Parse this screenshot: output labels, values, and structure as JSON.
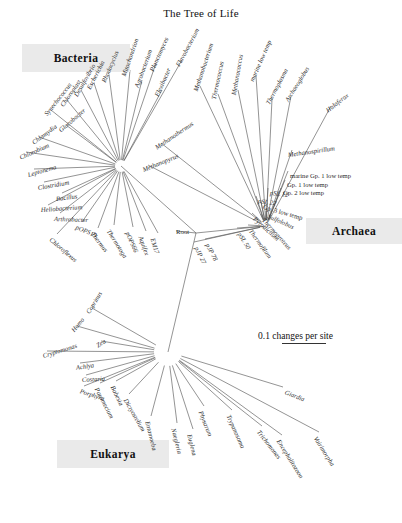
{
  "figure": {
    "title": "The Tree of Life",
    "scale": {
      "label": "0.1 changes per site"
    },
    "root_label": "Root"
  },
  "domains": {
    "bacteria": {
      "label": "Bacteria"
    },
    "archaea": {
      "label": "Archaea"
    },
    "eukarya": {
      "label": "Eukarya"
    }
  },
  "chart_data": {
    "type": "tree",
    "title": "The Tree of Life",
    "scale_bar": {
      "text": "0.1 changes per site",
      "value": 0.1,
      "units": "changes per site"
    },
    "root": "Root",
    "groups": [
      {
        "name": "Bacteria",
        "taxa": [
          "Planctomyces",
          "Mitochondrion",
          "Agrobacterium",
          "Rhodocyclus",
          "Escherichia",
          "Desulfovibrio",
          "Chloroplast",
          "Synechococcus",
          "Gloeobacter",
          "Chlamydia",
          "Chlorobium",
          "Leptonema",
          "Clostridium",
          "Bacillus",
          "Heliobacterium",
          "Arthrobacter",
          "pOPS19",
          "Chloroflexus",
          "Thermus",
          "Thermotoga",
          "pOPS66",
          "Aquifex",
          "EM17",
          "Flavobacterium",
          "Flexibacter"
        ]
      },
      {
        "name": "Archaea",
        "taxa": [
          "Methanopyrus",
          "Methanothermus",
          "Methanobacterium",
          "Thermococcus",
          "Methanococcus",
          "marine low temp",
          "Thermoplasma",
          "Archaeoglobus",
          "Haloferax",
          "Methanospirillum",
          "marine Gp. 1 low temp",
          "Gp. 1 low temp",
          "Gp. 2 low temp",
          "pSL 12",
          "pSL 22",
          "Gp. 3 low temp",
          "Sulfolobus",
          "Pyrodictium",
          "Thermoproteus",
          "Thermofilum",
          "pSL 50",
          "pJP 78",
          "pJP 27"
        ]
      },
      {
        "name": "Eukarya",
        "taxa": [
          "Coprinus",
          "Homo",
          "Zea",
          "Cryptomonas",
          "Achlya",
          "Costaria",
          "Porphyra",
          "Paramecium",
          "Babesia",
          "Dictyostelium",
          "Entamoeba",
          "Naegleria",
          "Euglena",
          "Physarum",
          "Trypanosoma",
          "Giardia",
          "Trichomonas",
          "Encephalitozoon",
          "Vairimorpha"
        ]
      }
    ]
  },
  "tips": {
    "bacteria": [
      {
        "name": "Planctomyces",
        "x": 152,
        "y": 68,
        "rot": -66,
        "anchor": "start",
        "italic": true
      },
      {
        "name": "Mitochondrion",
        "x": 124,
        "y": 73,
        "rot": -71,
        "anchor": "start",
        "italic": true
      },
      {
        "name": "Agrobacterium",
        "x": 137,
        "y": 84,
        "rot": -70,
        "anchor": "start",
        "italic": true
      },
      {
        "name": "Rhodocyclus",
        "x": 104,
        "y": 79,
        "rot": -67,
        "anchor": "start",
        "italic": true
      },
      {
        "name": "Escherichia",
        "x": 89,
        "y": 86,
        "rot": -63,
        "anchor": "start",
        "italic": true
      },
      {
        "name": "Desulfovibrio",
        "x": 76,
        "y": 93,
        "rot": -60,
        "anchor": "start",
        "italic": true
      },
      {
        "name": "Chloroplast",
        "x": 62,
        "y": 103,
        "rot": -55,
        "anchor": "start",
        "italic": true
      },
      {
        "name": "Synechococcus",
        "x": 46,
        "y": 112,
        "rot": -52,
        "anchor": "start",
        "italic": true
      },
      {
        "name": "Gloeobacter",
        "x": 60,
        "y": 128,
        "rot": -41,
        "anchor": "start",
        "italic": true
      },
      {
        "name": "Chlamydia",
        "x": 33,
        "y": 140,
        "rot": -36,
        "anchor": "start",
        "italic": true
      },
      {
        "name": "Chlorobium",
        "x": 20,
        "y": 155,
        "rot": -24,
        "anchor": "start",
        "italic": true
      },
      {
        "name": "Leptonema",
        "x": 28,
        "y": 172,
        "rot": -16,
        "anchor": "start",
        "italic": true
      },
      {
        "name": "Clostridium",
        "x": 38,
        "y": 185,
        "rot": -10,
        "anchor": "start",
        "italic": true
      },
      {
        "name": "Bacillus",
        "x": 56,
        "y": 196,
        "rot": -7,
        "anchor": "start",
        "italic": true
      },
      {
        "name": "Heliobacterium",
        "x": 41,
        "y": 207,
        "rot": -4,
        "anchor": "start",
        "italic": true
      },
      {
        "name": "Arthrobacter",
        "x": 54,
        "y": 216,
        "rot": 2,
        "anchor": "start",
        "italic": true
      },
      {
        "name": "pOPS19",
        "x": 76,
        "y": 224,
        "rot": 23,
        "anchor": "start",
        "italic": true
      },
      {
        "name": "Chloroflexus",
        "x": 50,
        "y": 236,
        "rot": 40,
        "anchor": "start",
        "italic": true
      },
      {
        "name": "Thermus",
        "x": 92,
        "y": 230,
        "rot": 52,
        "anchor": "start",
        "italic": true
      },
      {
        "name": "Thermotoga",
        "x": 108,
        "y": 227,
        "rot": 58,
        "anchor": "start",
        "italic": true
      },
      {
        "name": "pOPS66",
        "x": 127,
        "y": 229,
        "rot": 66,
        "anchor": "start",
        "italic": true
      },
      {
        "name": "Aquifex",
        "x": 140,
        "y": 233,
        "rot": 70,
        "anchor": "start",
        "italic": true
      },
      {
        "name": "EM17",
        "x": 152,
        "y": 235,
        "rot": 72,
        "anchor": "start",
        "italic": true
      },
      {
        "name": "Flavobacterium",
        "x": 178,
        "y": 63,
        "rot": -62,
        "anchor": "start",
        "italic": true
      },
      {
        "name": "Flexibacter",
        "x": 157,
        "y": 93,
        "rot": -66,
        "anchor": "start",
        "italic": true
      }
    ],
    "archaea": [
      {
        "name": "Methanobacterium",
        "x": 196,
        "y": 88,
        "rot": -72,
        "anchor": "start",
        "italic": true
      },
      {
        "name": "Thermococcus",
        "x": 214,
        "y": 96,
        "rot": -78,
        "anchor": "start",
        "italic": true
      },
      {
        "name": "Methanococcus",
        "x": 234,
        "y": 92,
        "rot": -80,
        "anchor": "start",
        "italic": true
      },
      {
        "name": "marine low temp",
        "x": 252,
        "y": 78,
        "rot": -66,
        "anchor": "start",
        "italic": true
      },
      {
        "name": "Thermoplasma",
        "x": 268,
        "y": 101,
        "rot": -62,
        "anchor": "start",
        "italic": true
      },
      {
        "name": "Archaeoglobus",
        "x": 287,
        "y": 98,
        "rot": -58,
        "anchor": "start",
        "italic": true
      },
      {
        "name": "Haloferax",
        "x": 327,
        "y": 108,
        "rot": -38,
        "anchor": "start",
        "italic": true
      },
      {
        "name": "Methanospirillum",
        "x": 288,
        "y": 152,
        "rot": -8,
        "anchor": "start",
        "italic": true
      },
      {
        "name": "Methanothermus",
        "x": 156,
        "y": 145,
        "rot": -34,
        "anchor": "start",
        "italic": true
      },
      {
        "name": "Methanopyrus",
        "x": 143,
        "y": 167,
        "rot": -22,
        "anchor": "start",
        "italic": true
      },
      {
        "name": "marine Gp. 1 low temp",
        "x": 290,
        "y": 173,
        "rot": 0,
        "anchor": "start",
        "italic": false
      },
      {
        "name": "Gp. 1 low temp",
        "x": 287,
        "y": 182,
        "rot": 0,
        "anchor": "start",
        "italic": false
      },
      {
        "name": "Gp. 2 low temp",
        "x": 283,
        "y": 190,
        "rot": 0,
        "anchor": "start",
        "italic": false
      },
      {
        "name": "pSL 12",
        "x": 270,
        "y": 190,
        "rot": 6,
        "anchor": "start",
        "italic": true
      },
      {
        "name": "pSL 22",
        "x": 258,
        "y": 198,
        "rot": 8,
        "anchor": "start",
        "italic": true
      },
      {
        "name": "Gp. 3 low temp",
        "x": 263,
        "y": 204,
        "rot": 16,
        "anchor": "start",
        "italic": false
      },
      {
        "name": "Sulfolobus",
        "x": 268,
        "y": 213,
        "rot": 24,
        "anchor": "start",
        "italic": true
      },
      {
        "name": "Pyrodictium",
        "x": 254,
        "y": 215,
        "rot": 42,
        "anchor": "start",
        "italic": true
      },
      {
        "name": "Thermoproteus",
        "x": 263,
        "y": 216,
        "rot": 48,
        "anchor": "start",
        "italic": true
      },
      {
        "name": "Thermofilum",
        "x": 250,
        "y": 227,
        "rot": 54,
        "anchor": "start",
        "italic": true
      },
      {
        "name": "pSL 50",
        "x": 239,
        "y": 230,
        "rot": 58,
        "anchor": "start",
        "italic": true
      },
      {
        "name": "pJP 78",
        "x": 207,
        "y": 241,
        "rot": 62,
        "anchor": "start",
        "italic": true
      },
      {
        "name": "pJP 27",
        "x": 196,
        "y": 244,
        "rot": 64,
        "anchor": "start",
        "italic": true
      }
    ],
    "eukarya": [
      {
        "name": "Coprinus",
        "x": 88,
        "y": 310,
        "rot": -58,
        "anchor": "start",
        "italic": true
      },
      {
        "name": "Homo",
        "x": 73,
        "y": 328,
        "rot": -50,
        "anchor": "start",
        "italic": true
      },
      {
        "name": "Zea",
        "x": 97,
        "y": 343,
        "rot": -32,
        "anchor": "start",
        "italic": true
      },
      {
        "name": "Cryptomonas",
        "x": 43,
        "y": 353,
        "rot": -17,
        "anchor": "start",
        "italic": true
      },
      {
        "name": "Achlya",
        "x": 76,
        "y": 365,
        "rot": -9,
        "anchor": "start",
        "italic": true
      },
      {
        "name": "Costaria",
        "x": 82,
        "y": 377,
        "rot": -3,
        "anchor": "start",
        "italic": true
      },
      {
        "name": "Porphyra",
        "x": 80,
        "y": 388,
        "rot": 18,
        "anchor": "start",
        "italic": true
      },
      {
        "name": "Paramecium",
        "x": 96,
        "y": 385,
        "rot": 62,
        "anchor": "start",
        "italic": true
      },
      {
        "name": "Babesia",
        "x": 112,
        "y": 383,
        "rot": 64,
        "anchor": "start",
        "italic": true
      },
      {
        "name": "Dictyostelium",
        "x": 125,
        "y": 396,
        "rot": 60,
        "anchor": "start",
        "italic": true
      },
      {
        "name": "Entamoeba",
        "x": 147,
        "y": 418,
        "rot": 76,
        "anchor": "start",
        "italic": true
      },
      {
        "name": "Naegleria",
        "x": 173,
        "y": 425,
        "rot": 76,
        "anchor": "start",
        "italic": true
      },
      {
        "name": "Euglena",
        "x": 189,
        "y": 431,
        "rot": 76,
        "anchor": "start",
        "italic": true
      },
      {
        "name": "Physarum",
        "x": 200,
        "y": 408,
        "rot": 68,
        "anchor": "start",
        "italic": true
      },
      {
        "name": "Trypanosoma",
        "x": 228,
        "y": 412,
        "rot": 66,
        "anchor": "start",
        "italic": true
      },
      {
        "name": "Giardia",
        "x": 285,
        "y": 389,
        "rot": 22,
        "anchor": "start",
        "italic": true
      },
      {
        "name": "Trichomonas",
        "x": 258,
        "y": 428,
        "rot": 52,
        "anchor": "start",
        "italic": true
      },
      {
        "name": "Encephalitozoon",
        "x": 278,
        "y": 437,
        "rot": 58,
        "anchor": "start",
        "italic": true
      },
      {
        "name": "Vairimorpha",
        "x": 315,
        "y": 434,
        "rot": 58,
        "anchor": "start",
        "italic": true
      }
    ]
  },
  "branches": {
    "bacteria_node": {
      "x": 121,
      "y": 166
    },
    "archaea_node": {
      "x": 266,
      "y": 226
    },
    "eukarya_node": {
      "x": 168,
      "y": 352
    },
    "root_node": {
      "x": 196,
      "y": 233
    },
    "bacteria_tips": [
      [
        156,
        63
      ],
      [
        130,
        70
      ],
      [
        142,
        80
      ],
      [
        109,
        75
      ],
      [
        94,
        83
      ],
      [
        81,
        90
      ],
      [
        67,
        100
      ],
      [
        51,
        110
      ],
      [
        66,
        125
      ],
      [
        39,
        137
      ],
      [
        26,
        152
      ],
      [
        34,
        169
      ],
      [
        44,
        182
      ],
      [
        62,
        193
      ],
      [
        48,
        205
      ],
      [
        60,
        213
      ],
      [
        82,
        222
      ],
      [
        57,
        234
      ],
      [
        98,
        228
      ],
      [
        114,
        225
      ],
      [
        133,
        227
      ],
      [
        146,
        231
      ],
      [
        158,
        233
      ],
      [
        182,
        60
      ],
      [
        162,
        90
      ]
    ],
    "archaea_tips": [
      [
        200,
        86
      ],
      [
        218,
        94
      ],
      [
        238,
        90
      ],
      [
        256,
        76
      ],
      [
        272,
        99
      ],
      [
        291,
        96
      ],
      [
        331,
        106
      ],
      [
        292,
        150
      ],
      [
        161,
        143
      ],
      [
        148,
        165
      ],
      [
        288,
        171
      ],
      [
        285,
        180
      ],
      [
        281,
        188
      ],
      [
        268,
        188
      ],
      [
        256,
        196
      ],
      [
        261,
        202
      ],
      [
        266,
        211
      ],
      [
        252,
        213
      ],
      [
        261,
        214
      ],
      [
        248,
        225
      ],
      [
        237,
        228
      ],
      [
        205,
        239
      ],
      [
        194,
        242
      ]
    ],
    "eukarya_tips": [
      [
        92,
        308
      ],
      [
        77,
        326
      ],
      [
        101,
        341
      ],
      [
        47,
        351
      ],
      [
        80,
        363
      ],
      [
        86,
        375
      ],
      [
        84,
        386
      ],
      [
        100,
        383
      ],
      [
        116,
        381
      ],
      [
        129,
        394
      ],
      [
        151,
        416
      ],
      [
        177,
        423
      ],
      [
        193,
        429
      ],
      [
        204,
        406
      ],
      [
        232,
        410
      ],
      [
        283,
        387
      ],
      [
        262,
        426
      ],
      [
        282,
        435
      ],
      [
        319,
        432
      ]
    ]
  }
}
